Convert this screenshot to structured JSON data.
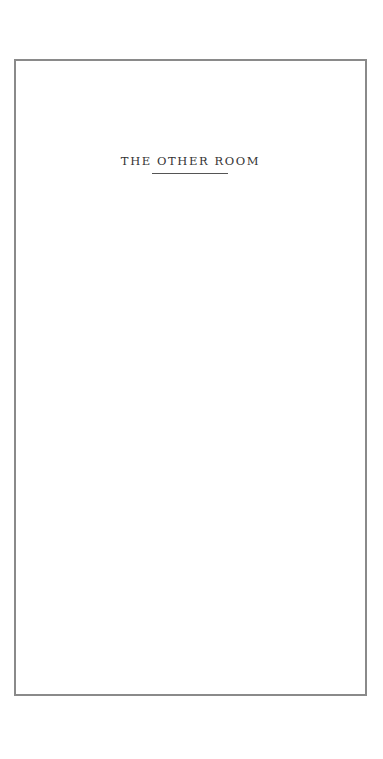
{
  "document": {
    "title": "THE OTHER ROOM"
  }
}
